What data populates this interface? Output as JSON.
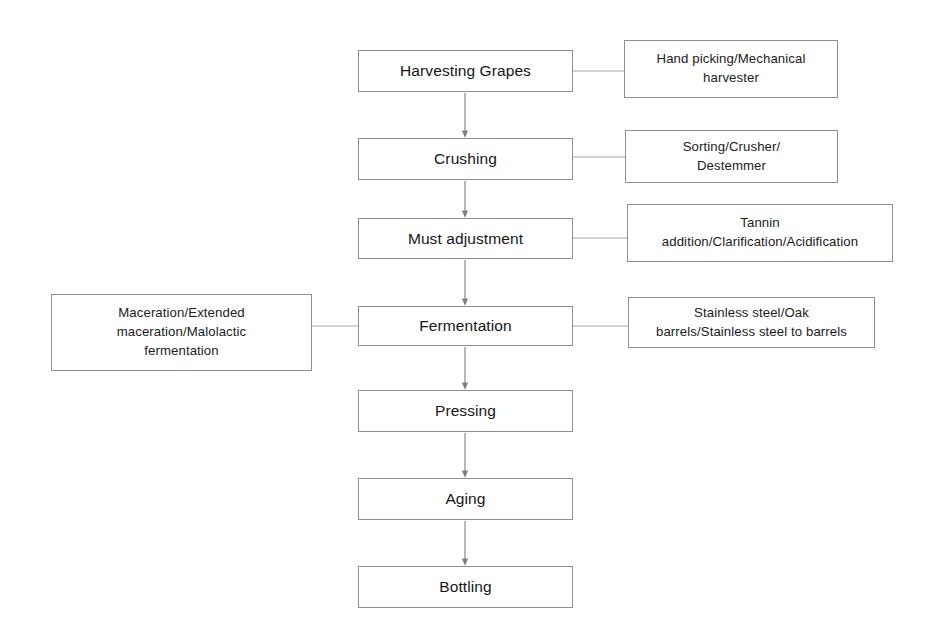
{
  "diagram": {
    "background_color": "#ffffff",
    "border_color": "#8f8f8f",
    "arrow_color": "#7d7d7d",
    "connector_color": "#a6a6a6"
  },
  "steps": [
    {
      "id": "harvesting",
      "label": "Harvesting Grapes",
      "x": 358,
      "y": 50,
      "w": 215,
      "h": 42
    },
    {
      "id": "crushing",
      "label": "Crushing",
      "x": 358,
      "y": 138,
      "w": 215,
      "h": 42
    },
    {
      "id": "must-adjustment",
      "label": "Must adjustment",
      "x": 358,
      "y": 218,
      "w": 215,
      "h": 41
    },
    {
      "id": "fermentation",
      "label": "Fermentation",
      "x": 358,
      "y": 306,
      "w": 215,
      "h": 40
    },
    {
      "id": "pressing",
      "label": "Pressing",
      "x": 358,
      "y": 390,
      "w": 215,
      "h": 42
    },
    {
      "id": "aging",
      "label": "Aging",
      "x": 358,
      "y": 478,
      "w": 215,
      "h": 42
    },
    {
      "id": "bottling",
      "label": "Bottling",
      "x": 358,
      "y": 566,
      "w": 215,
      "h": 42
    }
  ],
  "notes": [
    {
      "id": "harvesting-methods",
      "label": "Hand picking/Mechanical\nharvester",
      "side": "right",
      "x": 624,
      "y": 40,
      "w": 214,
      "h": 58
    },
    {
      "id": "crushing-methods",
      "label": "Sorting/Crusher/\nDestemmer",
      "side": "right",
      "x": 625,
      "y": 130,
      "w": 213,
      "h": 53
    },
    {
      "id": "must-adjustment-methods",
      "label": "Tannin\naddition/Clarification/Acidification",
      "side": "right",
      "x": 627,
      "y": 204,
      "w": 266,
      "h": 58
    },
    {
      "id": "fermentation-vessels",
      "label": "Stainless steel/Oak\nbarrels/Stainless steel to barrels",
      "side": "right",
      "x": 628,
      "y": 297,
      "w": 247,
      "h": 51
    },
    {
      "id": "fermentation-techniques",
      "label": "Maceration/Extended\nmaceration/Malolactic\nfermentation",
      "side": "left",
      "x": 51,
      "y": 294,
      "w": 261,
      "h": 77
    }
  ],
  "arrows": [
    {
      "id": "harvesting-to-crushing",
      "from": "harvesting",
      "to": "crushing",
      "x": 465,
      "y1": 92,
      "y2": 138
    },
    {
      "id": "crushing-to-must-adjustment",
      "from": "crushing",
      "to": "must-adjustment",
      "x": 465,
      "y1": 180,
      "y2": 218
    },
    {
      "id": "must-adjustment-to-fermentation",
      "from": "must-adjustment",
      "to": "fermentation",
      "x": 465,
      "y1": 259,
      "y2": 306
    },
    {
      "id": "fermentation-to-pressing",
      "from": "fermentation",
      "to": "pressing",
      "x": 465,
      "y1": 346,
      "y2": 390
    },
    {
      "id": "pressing-to-aging",
      "from": "pressing",
      "to": "aging",
      "x": 465,
      "y1": 432,
      "y2": 478
    },
    {
      "id": "aging-to-bottling",
      "from": "aging",
      "to": "bottling",
      "x": 465,
      "y1": 520,
      "y2": 566
    }
  ],
  "connectors": [
    {
      "id": "harvesting-note-link",
      "x1": 573,
      "x2": 624,
      "y": 71
    },
    {
      "id": "crushing-note-link",
      "x1": 573,
      "x2": 625,
      "y": 157
    },
    {
      "id": "must-adjustment-note-link",
      "x1": 573,
      "x2": 627,
      "y": 238
    },
    {
      "id": "fermentation-right-link",
      "x1": 573,
      "x2": 628,
      "y": 326
    },
    {
      "id": "fermentation-left-link",
      "x1": 312,
      "x2": 358,
      "y": 326
    }
  ]
}
